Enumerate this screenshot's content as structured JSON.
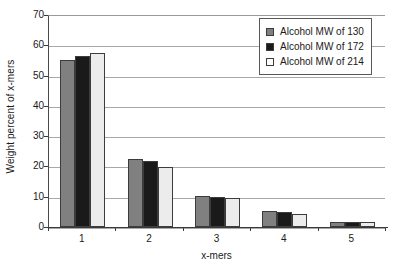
{
  "chart_data": {
    "type": "bar",
    "title": "",
    "subtitle": "",
    "xlabel": "x-mers",
    "ylabel": "Weight percent of x-mers",
    "categories": [
      "1",
      "2",
      "3",
      "4",
      "5"
    ],
    "series": [
      {
        "name": "Alcohol MW of 130",
        "color": "#808080",
        "values": [
          55.0,
          22.3,
          10.4,
          5.3,
          1.8
        ]
      },
      {
        "name": "Alcohol MW of 172",
        "color": "#1a1a1a",
        "values": [
          56.5,
          21.8,
          10.0,
          4.8,
          1.7
        ]
      },
      {
        "name": "Alcohol MW of 214",
        "color": "#ececec",
        "values": [
          57.5,
          19.7,
          9.6,
          4.3,
          1.6
        ]
      }
    ],
    "ylim": [
      0,
      70
    ],
    "ytick_step": 10,
    "ytick_labels": [
      "0",
      "10",
      "20",
      "30",
      "40",
      "50",
      "60",
      "70"
    ],
    "grid": true,
    "grid_axis": "y",
    "legend_position": "top-right",
    "bar_border_color": "#3c3c3c",
    "gridline_color": "#a8a8a8",
    "axis_color": "#3a3a3a",
    "background": "#ffffff"
  }
}
